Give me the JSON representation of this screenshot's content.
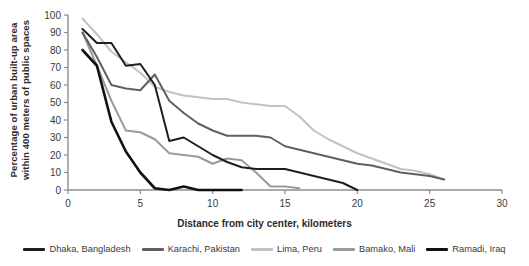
{
  "chart_data": {
    "type": "line",
    "title": "",
    "xlabel": "Distance from city center, kilometers",
    "ylabel": "Percentage of urban built-up area within 400 meters of public spaces",
    "ylabel_line1": "Percentage of urban built-up area",
    "ylabel_line2": "within 400 meters of public spaces",
    "xlim": [
      0,
      30
    ],
    "ylim": [
      0,
      100
    ],
    "xticks": [
      0,
      5,
      10,
      15,
      20,
      25,
      30
    ],
    "yticks": [
      0,
      10,
      20,
      30,
      40,
      50,
      60,
      70,
      80,
      90,
      100
    ],
    "grid": false,
    "legend_position": "bottom",
    "series": [
      {
        "name": "Dhaka, Bangladesh",
        "color": "#1f1f1f",
        "x": [
          1,
          2,
          3,
          4,
          5,
          6,
          7,
          8,
          9,
          10,
          11,
          12,
          13,
          14,
          15,
          16,
          17,
          18,
          19,
          20
        ],
        "y": [
          92,
          84,
          84,
          71,
          72,
          60,
          28,
          30,
          25,
          20,
          16,
          13,
          12,
          12,
          12,
          10,
          8,
          6,
          4,
          0
        ]
      },
      {
        "name": "Karachi, Pakistan",
        "color": "#606060",
        "x": [
          1,
          2,
          3,
          4,
          5,
          6,
          7,
          8,
          9,
          10,
          11,
          12,
          13,
          14,
          15,
          16,
          17,
          18,
          19,
          20,
          21,
          22,
          23,
          24,
          25,
          26
        ],
        "y": [
          90,
          76,
          60,
          58,
          57,
          66,
          51,
          44,
          38,
          34,
          31,
          31,
          31,
          30,
          25,
          23,
          21,
          19,
          17,
          15,
          14,
          12,
          10,
          9,
          8,
          6
        ]
      },
      {
        "name": "Lima, Peru",
        "color": "#c2c2c2",
        "x": [
          1,
          2,
          3,
          4,
          5,
          6,
          7,
          8,
          9,
          10,
          11,
          12,
          13,
          14,
          15,
          16,
          17,
          18,
          19,
          20,
          21,
          22,
          23,
          24,
          25,
          26
        ],
        "y": [
          98,
          89,
          79,
          73,
          67,
          59,
          56,
          54,
          53,
          52,
          52,
          50,
          49,
          48,
          48,
          42,
          34,
          29,
          25,
          21,
          18,
          15,
          12,
          11,
          9,
          6
        ]
      },
      {
        "name": "Bamako, Mali",
        "color": "#9a9a9a",
        "x": [
          1,
          2,
          3,
          4,
          5,
          6,
          7,
          8,
          9,
          10,
          11,
          12,
          13,
          14,
          15,
          16
        ],
        "y": [
          90,
          71,
          51,
          34,
          33,
          29,
          21,
          20,
          19,
          15,
          18,
          17,
          10,
          2,
          2,
          1
        ]
      },
      {
        "name": "Ramadi, Iraq",
        "color": "#111111",
        "x": [
          1,
          2,
          3,
          4,
          5,
          6,
          7,
          8,
          9,
          10,
          11,
          12
        ],
        "y": [
          80,
          71,
          39,
          22,
          10,
          1,
          0,
          2,
          0,
          0,
          0,
          0
        ]
      }
    ]
  },
  "legend": {
    "items": [
      {
        "label": "Dhaka, Bangladesh",
        "color": "#1f1f1f"
      },
      {
        "label": "Karachi, Pakistan",
        "color": "#606060"
      },
      {
        "label": "Lima, Peru",
        "color": "#c2c2c2"
      },
      {
        "label": "Bamako, Mali",
        "color": "#9a9a9a"
      },
      {
        "label": "Ramadi, Iraq",
        "color": "#111111"
      }
    ]
  },
  "axes": {
    "axis_color": "#8c8c8c"
  }
}
